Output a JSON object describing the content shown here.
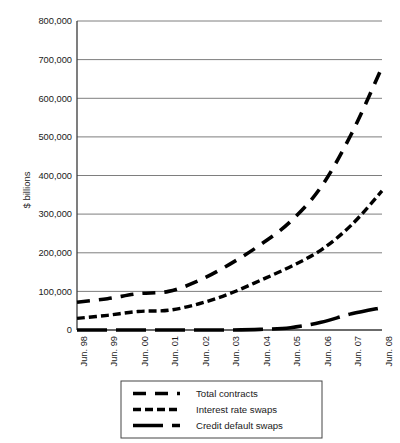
{
  "chart_data": {
    "type": "line",
    "title": "",
    "xlabel": "",
    "ylabel": "$ billions",
    "ylim": [
      0,
      800000
    ],
    "ytick_labels": [
      "0",
      "100,000",
      "200,000",
      "300,000",
      "400,000",
      "500,000",
      "600,000",
      "700,000",
      "800,000"
    ],
    "ytick_values": [
      0,
      100000,
      200000,
      300000,
      400000,
      500000,
      600000,
      700000,
      800000
    ],
    "grid": true,
    "grid_axis": "y",
    "legend_position": "bottom",
    "categories": [
      "Jun. 98",
      "Jun. 99",
      "Jun. 00",
      "Jun. 01",
      "Jun. 02",
      "Jun. 03",
      "Jun. 04",
      "Jun. 05",
      "Jun. 06",
      "Jun. 07",
      "Jun. 08"
    ],
    "x": [
      "Jun. 98",
      "Jun. 99",
      "Jun. 00",
      "Jun. 01",
      "Jun. 02",
      "Jun. 03",
      "Jun. 04",
      "Jun. 05",
      "Jun. 06",
      "Jun. 07",
      "Jun. 08"
    ],
    "series": [
      {
        "name": "Total contracts",
        "color": "#000000",
        "dash": "long",
        "values": [
          72000,
          81000,
          94000,
          100000,
          128000,
          170000,
          220000,
          281000,
          370000,
          508000,
          680000
        ]
      },
      {
        "name": "Interest rate swaps",
        "color": "#000000",
        "dash": "medium",
        "values": [
          30000,
          38000,
          48000,
          51000,
          68000,
          94000,
          128000,
          164000,
          207000,
          272000,
          360000
        ]
      },
      {
        "name": "Credit default swaps",
        "color": "#000000",
        "dash": "solid-long",
        "values": [
          0,
          0,
          0,
          0,
          0,
          0,
          1500,
          6000,
          20000,
          42000,
          58000
        ]
      }
    ]
  },
  "legend": {
    "items": [
      {
        "label": "Total contracts",
        "dash": "long"
      },
      {
        "label": "Interest rate swaps",
        "dash": "medium"
      },
      {
        "label": "Credit default swaps",
        "dash": "solid-long"
      }
    ]
  },
  "axes": {
    "y_axis_title": "$ billions"
  }
}
